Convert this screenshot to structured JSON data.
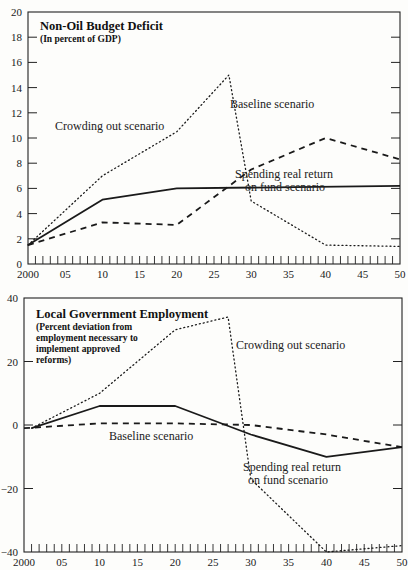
{
  "chart_data": [
    {
      "type": "line",
      "title": "Non-Oil Budget Deficit",
      "subtitle": "(In percent of GDP)",
      "xlabel": "",
      "ylabel": "",
      "x_ticks": [
        "2000",
        "05",
        "10",
        "15",
        "20",
        "25",
        "30",
        "35",
        "40",
        "45",
        "50"
      ],
      "y_ticks": [
        0,
        2,
        4,
        6,
        8,
        10,
        12,
        14,
        16,
        18,
        20
      ],
      "xlim": [
        2000,
        2050
      ],
      "ylim": [
        0,
        20
      ],
      "grid": false,
      "series": [
        {
          "name": "Spending real return on fund scenario",
          "style": "solid",
          "x": [
            2000,
            2010,
            2020,
            2050
          ],
          "values": [
            1.5,
            5.1,
            6.0,
            6.2
          ]
        },
        {
          "name": "Baseline scenario",
          "style": "dashed",
          "x": [
            2000,
            2010,
            2020,
            2030,
            2040,
            2050
          ],
          "values": [
            1.5,
            3.3,
            3.1,
            7.5,
            10.0,
            8.3
          ]
        },
        {
          "name": "Crowding out scenario",
          "style": "dotted",
          "x": [
            2000,
            2010,
            2020,
            2027,
            2030,
            2040,
            2050
          ],
          "values": [
            1.5,
            7.0,
            10.5,
            15.0,
            5.0,
            1.5,
            1.4
          ]
        }
      ],
      "annotations": [
        {
          "text": "Crowding out scenario",
          "x": 2007,
          "y": 12.3
        },
        {
          "text": "Baseline scenario",
          "x": 2035,
          "y": 10.9
        },
        {
          "text": "Spending real return",
          "x": 2035,
          "y": 5.3
        },
        {
          "text": "on fund scenario",
          "x": 2037,
          "y": 4.2
        }
      ]
    },
    {
      "type": "line",
      "title": "Local Government Employment",
      "subtitle_lines": [
        "(Percent deviation from",
        "employment necessary to",
        "implement approved",
        "reforms)"
      ],
      "xlabel": "",
      "ylabel": "",
      "x_ticks": [
        "2000",
        "05",
        "10",
        "15",
        "20",
        "25",
        "30",
        "35",
        "40",
        "45",
        "50"
      ],
      "y_ticks": [
        -40,
        -20,
        0,
        20,
        40
      ],
      "xlim": [
        2000,
        2050
      ],
      "ylim": [
        -40,
        40
      ],
      "grid": false,
      "series": [
        {
          "name": "Spending real return on fund scenario",
          "style": "solid",
          "x": [
            2001,
            2010,
            2020,
            2030,
            2040,
            2050
          ],
          "values": [
            -1,
            6,
            6,
            -3,
            -10,
            -7
          ]
        },
        {
          "name": "Baseline scenario",
          "style": "dashed",
          "x": [
            2000,
            2010,
            2020,
            2030,
            2040,
            2050
          ],
          "values": [
            -1,
            0.5,
            0.5,
            0,
            -3,
            -7
          ]
        },
        {
          "name": "Crowding out scenario",
          "style": "dotted",
          "x": [
            2001,
            2010,
            2020,
            2027,
            2030,
            2040,
            2050
          ],
          "values": [
            -1,
            10,
            30,
            34,
            -17,
            -40,
            -38
          ]
        }
      ],
      "annotations": [
        {
          "text": "Crowding out scenario",
          "x": 2030,
          "y": 30
        },
        {
          "text": "Baseline scenario",
          "x": 2012,
          "y": -3.5
        },
        {
          "text": "Spending real return",
          "x": 2034,
          "y": -16
        },
        {
          "text": "on fund scenario",
          "x": 2036,
          "y": -22
        }
      ]
    }
  ]
}
